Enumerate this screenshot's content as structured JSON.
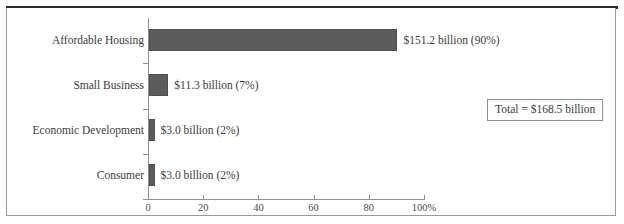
{
  "figure": {
    "clipped_caption": "",
    "total_callout": "Total = $168.5 billion"
  },
  "chart_data": {
    "type": "bar",
    "orientation": "horizontal",
    "title": "",
    "subtitle": "",
    "xlabel": "",
    "ylabel": "",
    "xlim": [
      0,
      100
    ],
    "grid": false,
    "legend": null,
    "unit": "percent of total",
    "total_label": "Total = $168.5 billion",
    "total_value": 168.5,
    "categories": [
      "Affordable Housing",
      "Small Business",
      "Economic Development",
      "Consumer"
    ],
    "values": [
      90,
      7,
      2,
      2
    ],
    "dollar_values": [
      151.2,
      11.3,
      3.0,
      3.0
    ],
    "data_labels": [
      "$151.2 billion (90%)",
      "$11.3 billion (7%)",
      "$3.0 billion (2%)",
      "$3.0 billion (2%)"
    ],
    "xticks": [
      0,
      20,
      40,
      60,
      80,
      100
    ],
    "xtick_labels": [
      "0",
      "20",
      "40",
      "60",
      "80",
      "100%"
    ],
    "bar_color": "#5c5c5c",
    "axis_color": "#8e8e8e",
    "text_color": "#3a3a3a"
  }
}
